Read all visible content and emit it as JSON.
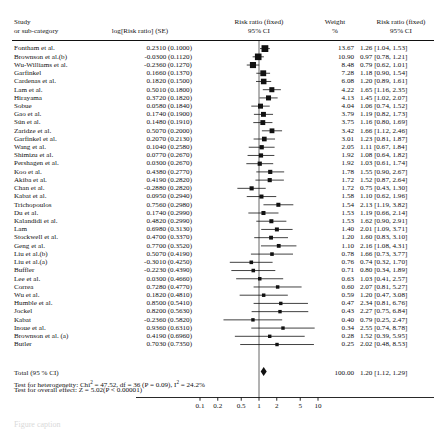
{
  "header": {
    "col_study_line1": "Study",
    "col_study_line2": "or sub-category",
    "col_log": "log[Risk ratio] (SE)",
    "col_plot_line1": "Risk ratio (fixed)",
    "col_plot_line2": "95% CI",
    "col_weight_line1": "Weight",
    "col_weight_line2": "%",
    "col_rr_line1": "Risk ratio (fixed)",
    "col_rr_line2": "95% CI"
  },
  "footer": {
    "total_label": "Total (95 % CI)",
    "heterogeneity": "Test for heterogeneity: Chi² = 47.52, df = 36 (P = 0.09), I² = 24.2%",
    "overall": "Test for overall effect: Z = 5.02(P < 0.00001)",
    "total_weight": "100.00",
    "total_rr": "1.20 [1.12, 1.29]"
  },
  "axis": {
    "ticks": [
      "0.1",
      "0.2",
      "0.5",
      "1",
      "2",
      "5",
      "10"
    ],
    "tick_values": [
      0.1,
      0.2,
      0.5,
      1,
      2,
      5,
      10
    ],
    "null_value": 1
  },
  "chart_data": {
    "type": "forest",
    "xlabel": "",
    "xscale": "log",
    "xlim": [
      0.07,
      16
    ],
    "null_line": 1,
    "columns": [
      "Study or sub-category",
      "log[Risk ratio] (SE)",
      "Weight %",
      "Risk ratio (fixed) 95% CI"
    ],
    "rows": [
      {
        "study": "Fontham et al.",
        "log": "0.2310 (0.1000)",
        "weight": "13.67",
        "rr": "1.26 [1.04, 1.53]",
        "est": 1.26,
        "lo": 1.04,
        "hi": 1.53,
        "w": 13.67
      },
      {
        "study": "Brownson et al.(b)",
        "log": "-0.0300 (0.1120)",
        "weight": "10.90",
        "rr": "0.97 [0.78, 1.21]",
        "est": 0.97,
        "lo": 0.78,
        "hi": 1.21,
        "w": 10.9
      },
      {
        "study": "Wu-Williams et al.",
        "log": "-0.2360 (0.1270)",
        "weight": "8.48",
        "rr": "0.79 [0.62, 1.01]",
        "est": 0.79,
        "lo": 0.62,
        "hi": 1.01,
        "w": 8.48
      },
      {
        "study": "Garfinkel",
        "log": "0.1660 (0.1370)",
        "weight": "7.28",
        "rr": "1.18 [0.90, 1.54]",
        "est": 1.18,
        "lo": 0.9,
        "hi": 1.54,
        "w": 7.28
      },
      {
        "study": "Cardenas et al.",
        "log": "0.1820 (0.1500)",
        "weight": "6.08",
        "rr": "1.20 [0.89, 1.61]",
        "est": 1.2,
        "lo": 0.89,
        "hi": 1.61,
        "w": 6.08
      },
      {
        "study": "Lam et al.",
        "log": "0.5010 (0.1800)",
        "weight": "4.22",
        "rr": "1.65 [1.16, 2.35]",
        "est": 1.65,
        "lo": 1.16,
        "hi": 2.35,
        "w": 4.22
      },
      {
        "study": "Hirayama",
        "log": "0.3720 (0.1820)",
        "weight": "4.13",
        "rr": "1.45 [1.02, 2.07]",
        "est": 1.45,
        "lo": 1.02,
        "hi": 2.07,
        "w": 4.13
      },
      {
        "study": "Sobue",
        "log": "0.0580 (0.1840)",
        "weight": "4.04",
        "rr": "1.06 [0.74, 1.52]",
        "est": 1.06,
        "lo": 0.74,
        "hi": 1.52,
        "w": 4.04
      },
      {
        "study": "Gao et al.",
        "log": "0.1740 (0.1900)",
        "weight": "3.79",
        "rr": "1.19 [0.82, 1.73]",
        "est": 1.19,
        "lo": 0.82,
        "hi": 1.73,
        "w": 3.79
      },
      {
        "study": "Sún et al.",
        "log": "0.1480 (0.1910)",
        "weight": "3.75",
        "rr": "1.16 [0.80, 1.69]",
        "est": 1.16,
        "lo": 0.8,
        "hi": 1.69,
        "w": 3.75
      },
      {
        "study": "Zaridze et al.",
        "log": "0.5070 (0.2000)",
        "weight": "3.42",
        "rr": "1.66 [1.12, 2.46]",
        "est": 1.66,
        "lo": 1.12,
        "hi": 2.46,
        "w": 3.42
      },
      {
        "study": "Garfinkel et al.",
        "log": "0.2070 (0.2130)",
        "weight": "3.01",
        "rr": "1.23 [0.81, 1.87]",
        "est": 1.23,
        "lo": 0.81,
        "hi": 1.87,
        "w": 3.01
      },
      {
        "study": "Wang et al.",
        "log": "0.1040 (0.2580)",
        "weight": "2.05",
        "rr": "1.11 [0.67, 1.84]",
        "est": 1.11,
        "lo": 0.67,
        "hi": 1.84,
        "w": 2.05
      },
      {
        "study": "Shimizu et al.",
        "log": "0.0770 (0.2670)",
        "weight": "1.92",
        "rr": "1.08 [0.64, 1.82]",
        "est": 1.08,
        "lo": 0.64,
        "hi": 1.82,
        "w": 1.92
      },
      {
        "study": "Pershagen et al.",
        "log": "0.0300 (0.2670)",
        "weight": "1.92",
        "rr": "1.03 [0.61, 1.74]",
        "est": 1.03,
        "lo": 0.61,
        "hi": 1.74,
        "w": 1.92
      },
      {
        "study": "Koo et al.",
        "log": "0.4380 (0.2770)",
        "weight": "1.78",
        "rr": "1.55 [0.90, 2.67]",
        "est": 1.55,
        "lo": 0.9,
        "hi": 2.67,
        "w": 1.78
      },
      {
        "study": "Akiba et al.",
        "log": "0.4190 (0.2820)",
        "weight": "1.72",
        "rr": "1.52 [0.87, 2.64]",
        "est": 1.52,
        "lo": 0.87,
        "hi": 2.64,
        "w": 1.72
      },
      {
        "study": "Chan et al.",
        "log": "-0.2880 (0.2820)",
        "weight": "1.72",
        "rr": "0.75 [0.43, 1.30]",
        "est": 0.75,
        "lo": 0.43,
        "hi": 1.3,
        "w": 1.72
      },
      {
        "study": "Kabat et al.",
        "log": "0.0950 (0.2940)",
        "weight": "1.58",
        "rr": "1.10 [0.62, 1.96]",
        "est": 1.1,
        "lo": 0.62,
        "hi": 1.96,
        "w": 1.58
      },
      {
        "study": "Trichopoulos",
        "log": "0.7560 (0.2980)",
        "weight": "1.54",
        "rr": "2.13 [1.19, 3.82]",
        "est": 2.13,
        "lo": 1.19,
        "hi": 3.82,
        "w": 1.54
      },
      {
        "study": "Du et al.",
        "log": "0.1740 (0.2990)",
        "weight": "1.53",
        "rr": "1.19 [0.66, 2.14]",
        "est": 1.19,
        "lo": 0.66,
        "hi": 2.14,
        "w": 1.53
      },
      {
        "study": "Kalandidi et al.",
        "log": "0.4820 (0.2990)",
        "weight": "1.53",
        "rr": "1.62 [0.90, 2.91]",
        "est": 1.62,
        "lo": 0.9,
        "hi": 2.91,
        "w": 1.53
      },
      {
        "study": "Lam",
        "log": "0.6980 (0.3130)",
        "weight": "1.40",
        "rr": "2.01 [1.09, 3.71]",
        "est": 2.01,
        "lo": 1.09,
        "hi": 3.71,
        "w": 1.4
      },
      {
        "study": "Stockwell et al.",
        "log": "0.4700 (0.3370)",
        "weight": "1.20",
        "rr": "1.60 [0.83, 3.10]",
        "est": 1.6,
        "lo": 0.83,
        "hi": 3.1,
        "w": 1.2
      },
      {
        "study": "Geng et al.",
        "log": "0.7700 (0.3520)",
        "weight": "1.10",
        "rr": "2.16 [1.08, 4.31]",
        "est": 2.16,
        "lo": 1.08,
        "hi": 4.31,
        "w": 1.1
      },
      {
        "study": "Liu et al.(b)",
        "log": "0.5070 (0.4190)",
        "weight": "0.78",
        "rr": "1.66 [0.73, 3.77]",
        "est": 1.66,
        "lo": 0.73,
        "hi": 3.77,
        "w": 0.78
      },
      {
        "study": "Liu et al.(a)",
        "log": "-0.3010 (0.4250)",
        "weight": "0.76",
        "rr": "0.74 [0.32, 1.70]",
        "est": 0.74,
        "lo": 0.32,
        "hi": 1.7,
        "w": 0.76
      },
      {
        "study": "Buffler",
        "log": "-0.2230 (0.4390)",
        "weight": "0.71",
        "rr": "0.80 [0.34, 1.89]",
        "est": 0.8,
        "lo": 0.34,
        "hi": 1.89,
        "w": 0.71
      },
      {
        "study": "Lee et al.",
        "log": "0.0300 (0.4660)",
        "weight": "0.63",
        "rr": "1.03 [0.41, 2.57]",
        "est": 1.03,
        "lo": 0.41,
        "hi": 2.57,
        "w": 0.63
      },
      {
        "study": "Correa",
        "log": "0.7280 (0.4770)",
        "weight": "0.60",
        "rr": "2.07 [0.81, 5.27]",
        "est": 2.07,
        "lo": 0.81,
        "hi": 5.27,
        "w": 0.6
      },
      {
        "study": "Wu et al.",
        "log": "0.1820 (0.4810)",
        "weight": "0.59",
        "rr": "1.20 [0.47, 3.08]",
        "est": 1.2,
        "lo": 0.47,
        "hi": 3.08,
        "w": 0.59
      },
      {
        "study": "Humble et al.",
        "log": "0.8500 (0.5410)",
        "weight": "0.47",
        "rr": "2.34 [0.81, 6.76]",
        "est": 2.34,
        "lo": 0.81,
        "hi": 6.76,
        "w": 0.47
      },
      {
        "study": "Jockel",
        "log": "0.8200 (0.5630)",
        "weight": "0.43",
        "rr": "2.27 [0.75, 6.84]",
        "est": 2.27,
        "lo": 0.75,
        "hi": 6.84,
        "w": 0.43
      },
      {
        "study": "Kabat",
        "log": "-0.2360 (0.5820)",
        "weight": "0.40",
        "rr": "0.79 [0.25, 2.47]",
        "est": 0.79,
        "lo": 0.25,
        "hi": 2.47,
        "w": 0.4
      },
      {
        "study": "Inoue et al.",
        "log": "0.9360 (0.6310)",
        "weight": "0.34",
        "rr": "2.55 [0.74, 8.78]",
        "est": 2.55,
        "lo": 0.74,
        "hi": 8.78,
        "w": 0.34
      },
      {
        "study": "Brownson et al. (a)",
        "log": "0.4190 (0.6960)",
        "weight": "0.28",
        "rr": "1.52 [0.39, 5.95]",
        "est": 1.52,
        "lo": 0.39,
        "hi": 5.95,
        "w": 0.28
      },
      {
        "study": "Butler",
        "log": "0.7030 (0.7350)",
        "weight": "0.25",
        "rr": "2.02 [0.48, 8.53]",
        "est": 2.02,
        "lo": 0.48,
        "hi": 8.53,
        "w": 0.25
      }
    ],
    "total": {
      "label": "Total (95 % CI)",
      "est": 1.2,
      "lo": 1.12,
      "hi": 1.29,
      "weight": "100.00",
      "rr": "1.20 [1.12, 1.29]"
    }
  }
}
